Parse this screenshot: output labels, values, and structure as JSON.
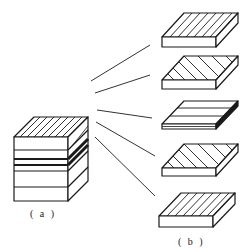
{
  "figure": {
    "label_a": "( a )",
    "label_b": "( b )",
    "stroke_color": "#1a1a1a",
    "background": "#ffffff",
    "stack": {
      "description": "laminate stack of five plies",
      "plies": 5
    },
    "plies": [
      {
        "index": 1,
        "orientation": "0°-like diagonal hatch (steep)"
      },
      {
        "index": 2,
        "orientation": "shallow diagonal hatch"
      },
      {
        "index": 3,
        "orientation": "horizontal hatch (90°)"
      },
      {
        "index": 4,
        "orientation": "shallow diagonal hatch"
      },
      {
        "index": 5,
        "orientation": "steep diagonal hatch"
      }
    ]
  }
}
